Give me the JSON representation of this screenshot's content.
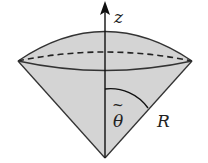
{
  "diagram": {
    "labels": {
      "axis": "z",
      "angle": "θ",
      "angle_accent": "~",
      "radius": "R"
    },
    "colors": {
      "fill": "#d4d4d4",
      "stroke": "#333333",
      "background": "#ffffff"
    }
  }
}
